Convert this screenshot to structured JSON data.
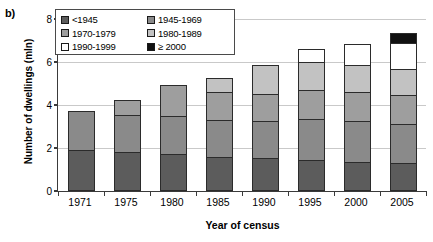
{
  "panel": {
    "label": "b)"
  },
  "axes": {
    "ylabel": "Number of dwellings (mln)",
    "xlabel": "Year of census",
    "yticks": [
      "0",
      "2",
      "4",
      "6",
      "8"
    ],
    "ymin": 0,
    "ymax": 8,
    "ytick_step": 2
  },
  "legend": {
    "items": [
      {
        "label": "<1945",
        "color": "#5c5c5c"
      },
      {
        "label": "1945-1969",
        "color": "#8a8a8a"
      },
      {
        "label": "1970-1979",
        "color": "#9e9e9e"
      },
      {
        "label": "1980-1989",
        "color": "#c2c2c2"
      },
      {
        "label": "1990-1999",
        "color": "#ffffff"
      },
      {
        "label": "≥ 2000",
        "color": "#111111"
      }
    ]
  },
  "chart_data": {
    "type": "bar",
    "subtype": "stacked-vertical",
    "title": "",
    "xlabel": "Year of census",
    "ylabel": "Number of dwellings (mln)",
    "ylim": [
      0,
      8
    ],
    "ytick_step": 2,
    "grid": true,
    "legend_position": "top-left-inside",
    "categories": [
      "1971",
      "1975",
      "1980",
      "1985",
      "1990",
      "1995",
      "2000",
      "2005"
    ],
    "series": [
      {
        "name": "<1945",
        "color": "#5c5c5c",
        "values": [
          1.9,
          1.82,
          1.72,
          1.58,
          1.54,
          1.44,
          1.35,
          1.3
        ]
      },
      {
        "name": "1945-1969",
        "color": "#8a8a8a",
        "values": [
          1.85,
          1.77,
          1.81,
          1.77,
          1.77,
          1.95,
          1.95,
          1.86
        ]
      },
      {
        "name": "1970-1979",
        "color": "#9e9e9e",
        "values": [
          0.05,
          0.74,
          1.49,
          1.35,
          1.3,
          1.4,
          1.4,
          1.4
        ]
      },
      {
        "name": "1980-1989",
        "color": "#c2c2c2",
        "values": [
          0.0,
          0.0,
          0.0,
          0.7,
          1.4,
          1.35,
          1.3,
          1.26
        ]
      },
      {
        "name": "1990-1999",
        "color": "#ffffff",
        "values": [
          0.0,
          0.0,
          0.0,
          0.0,
          0.0,
          0.65,
          1.02,
          1.26
        ]
      },
      {
        "name": "≥ 2000",
        "color": "#111111",
        "values": [
          0.0,
          0.0,
          0.0,
          0.0,
          0.0,
          0.0,
          0.0,
          0.51
        ]
      }
    ],
    "totals": [
      3.8,
      4.33,
      5.02,
      5.4,
      6.01,
      6.79,
      7.02,
      7.59
    ]
  }
}
